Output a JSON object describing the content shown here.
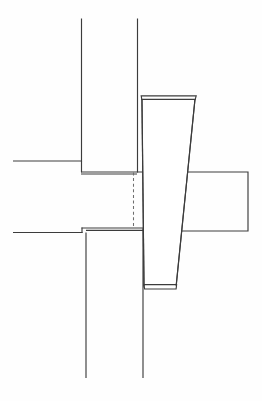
{
  "figure": {
    "title": "",
    "type": "technical-line-drawing",
    "canvas": {
      "width": 262,
      "height": 401
    },
    "background_color": "#ffffff",
    "line_color": "#3c3c3c",
    "hidden_line_color": "#6e6e6e",
    "labels": [],
    "dimensions": [],
    "annotations": []
  },
  "geometry": {
    "upper_member_left_edge": {
      "name": "upper-post-left-edge",
      "x1": 81.5,
      "y1": 18.5,
      "x2": 81.5,
      "y2": 161.5
    },
    "upper_member_right_edge": {
      "name": "upper-post-right-edge",
      "x1": 137.5,
      "y1": 18.5,
      "x2": 137.5,
      "y2": 172.0
    },
    "upper_shoulder_left": {
      "name": "upper-shoulder-left-horizontal",
      "x1": 13.0,
      "y1": 161.0,
      "x2": 81.5,
      "y2": 161.0
    },
    "upper_shoulder_step": {
      "name": "upper-shoulder-step-vertical",
      "x1": 81.5,
      "y1": 161.0,
      "x2": 81.5,
      "y2": 172.0
    },
    "upper_shoulder_face": {
      "name": "upper-shoulder-face-horizontal",
      "x1": 81.5,
      "y1": 172.0,
      "x2": 142.0,
      "y2": 172.0
    },
    "lower_shoulder_left": {
      "name": "lower-shoulder-left-horizontal",
      "x1": 13.0,
      "y1": 232.5,
      "x2": 82.0,
      "y2": 232.5
    },
    "lower_shoulder_step": {
      "name": "lower-shoulder-step-vertical",
      "x1": 82.0,
      "y1": 232.5,
      "x2": 82.0,
      "y2": 228.0
    },
    "lower_shoulder_face": {
      "name": "lower-shoulder-face-horizontal",
      "x1": 82.0,
      "y1": 228.0,
      "x2": 143.5,
      "y2": 228.0
    },
    "lower_member_left_edge": {
      "name": "lower-post-left-edge",
      "x1": 86.0,
      "y1": 232.5,
      "x2": 86.0,
      "y2": 378.0
    },
    "lower_member_right_edge": {
      "name": "lower-post-right-edge",
      "x1": 143.0,
      "y1": 228.0,
      "x2": 143.0,
      "y2": 378.0
    },
    "hidden_edge": {
      "name": "hidden-mortise-edge",
      "x1": 133.5,
      "y1": 172.5,
      "x2": 133.5,
      "y2": 227.5
    },
    "wedge_outer": {
      "name": "tapered-wedge-outline",
      "points": "142.0,99.0 195.0,99.0 176.0,287.0 144.0,287.0"
    },
    "wedge_top_cap": {
      "name": "wedge-top-chamfer",
      "points": "141.5,96.0 196.0,96.0 195.0,99.5 142.0,99.5"
    },
    "wedge_bottom_cap": {
      "name": "wedge-bottom-chamfer",
      "points": "144.0,285.0 176.5,285.0 176.0,289.0 144.5,289.0"
    },
    "cross_member": {
      "name": "right-cross-member-outline",
      "top_y": 172.0,
      "bottom_y": 231.0,
      "right_x": 248.0,
      "top_left_x": 188.0,
      "bottom_left_x": 181.0
    }
  },
  "viewer": {
    "zoom_level": "100%",
    "status": ""
  }
}
